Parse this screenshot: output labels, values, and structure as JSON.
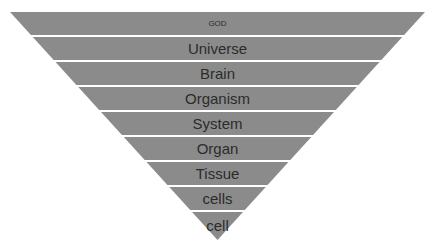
{
  "diagram": {
    "type": "inverted-pyramid",
    "fill_color": "#8b8b8b",
    "separator_color": "#ffffff",
    "text_color": "#2b2b2b",
    "levels": [
      {
        "label": "GOD",
        "size": 8
      },
      {
        "label": "Universe",
        "size": 15
      },
      {
        "label": "Brain",
        "size": 15
      },
      {
        "label": "Organism",
        "size": 15
      },
      {
        "label": "System",
        "size": 15
      },
      {
        "label": "Organ",
        "size": 15
      },
      {
        "label": "Tissue",
        "size": 15
      },
      {
        "label": "cells",
        "size": 15
      },
      {
        "label": "cell",
        "size": 15
      }
    ]
  }
}
